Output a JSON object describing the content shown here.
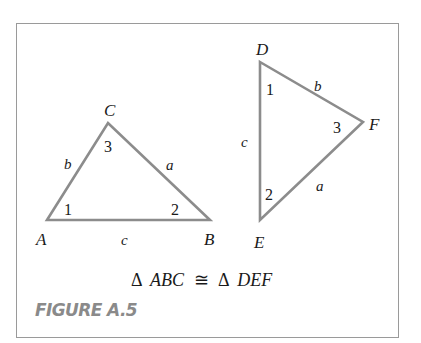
{
  "figure": {
    "caption": "FIGURE A.5",
    "equation": {
      "delta1": "Δ",
      "left": "ABC",
      "relation": "≅",
      "delta2": "Δ",
      "right": "DEF"
    },
    "triangle_abc": {
      "vertices": {
        "A": "A",
        "B": "B",
        "C": "C"
      },
      "sides": {
        "a": "a",
        "b": "b",
        "c": "c"
      },
      "angles": {
        "at_A": "1",
        "at_B": "2",
        "at_C": "3"
      }
    },
    "triangle_def": {
      "vertices": {
        "D": "D",
        "E": "E",
        "F": "F"
      },
      "sides": {
        "a": "a",
        "b": "b",
        "c": "c"
      },
      "angles": {
        "at_D": "1",
        "at_E": "2",
        "at_F": "3"
      }
    },
    "colors": {
      "stroke": "#8c8c8c",
      "frame": "#9a9a9a",
      "caption": "#8a8a8a",
      "text": "#1a1a1a"
    }
  }
}
